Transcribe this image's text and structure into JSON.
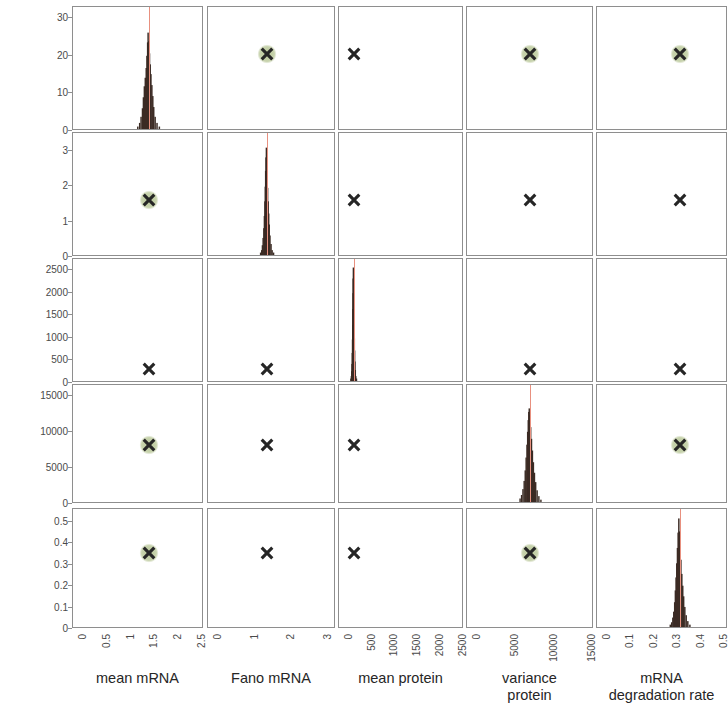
{
  "figure": {
    "title": "",
    "type": "pairs-plot",
    "n_params": 5
  },
  "row_labels": [
    {
      "lines": [
        "mean mRNA"
      ]
    },
    {
      "lines": [
        "Fano mRNA"
      ]
    },
    {
      "lines": [
        "mean protein"
      ]
    },
    {
      "lines": [
        "variance",
        "protein"
      ]
    },
    {
      "lines": [
        "mRNA",
        "degradation rate"
      ]
    }
  ],
  "col_labels": [
    {
      "lines": [
        "mean mRNA"
      ]
    },
    {
      "lines": [
        "Fano mRNA"
      ]
    },
    {
      "lines": [
        "mean protein"
      ]
    },
    {
      "lines": [
        "variance",
        "protein"
      ]
    },
    {
      "lines": [
        "mRNA",
        "degradation rate"
      ]
    }
  ],
  "y_ticks": [
    [
      "0",
      "10",
      "20",
      "30"
    ],
    [
      "0",
      "1",
      "2",
      "3"
    ],
    [
      "0",
      "500",
      "1000",
      "1500",
      "2000",
      "2500"
    ],
    [
      "0",
      "5000",
      "10000",
      "15000"
    ],
    [
      "0",
      "0.1",
      "0.2",
      "0.3",
      "0.4",
      "0.5"
    ]
  ],
  "x_ticks": [
    [
      "0",
      "0.5",
      "1",
      "1.5",
      "2",
      "2.5"
    ],
    [
      "0",
      "1",
      "2",
      "3"
    ],
    [
      "0",
      "500",
      "1000",
      "1500",
      "2000",
      "2500"
    ],
    [
      "0",
      "5000",
      "10000",
      "15000"
    ],
    [
      "0",
      "0.1",
      "0.2",
      "0.3",
      "0.4",
      "0.5"
    ]
  ],
  "colors": {
    "histogram": "#3b2b24",
    "truth_line": "#e8907f",
    "marker": "#262626",
    "halo": "#b9c79a",
    "axis": "#8e8e8e",
    "text": "#262626",
    "background": "#ffffff"
  },
  "chart_data": {
    "type": "scatter",
    "title": "",
    "xlabel": "",
    "ylabel": "",
    "parameters": [
      {
        "name": "mean mRNA",
        "axis_min": 0,
        "axis_max": 2.75,
        "tick_values": [
          0,
          0.5,
          1,
          1.5,
          2,
          2.5
        ],
        "truth": 1.6,
        "marker": 1.6
      },
      {
        "name": "Fano mRNA",
        "axis_min": 0,
        "axis_max": 3.5,
        "tick_values": [
          0,
          1,
          2,
          3
        ],
        "truth": 1.62,
        "marker": 1.62
      },
      {
        "name": "mean protein",
        "axis_min": 0,
        "axis_max": 2750,
        "tick_values": [
          0,
          500,
          1000,
          1500,
          2000,
          2500
        ],
        "truth": 320,
        "marker": 320
      },
      {
        "name": "variance protein",
        "axis_min": 0,
        "axis_max": 16500,
        "tick_values": [
          0,
          5000,
          10000,
          15000
        ],
        "truth": 8200,
        "marker": 8200
      },
      {
        "name": "mRNA degradation rate",
        "axis_min": 0,
        "axis_max": 0.56,
        "tick_values": [
          0,
          0.1,
          0.2,
          0.3,
          0.4,
          0.5
        ],
        "truth": 0.355,
        "marker": 0.355
      }
    ],
    "y_axis_ranges": [
      {
        "name": "mean mRNA",
        "min": 0,
        "max": 33,
        "tick_values": [
          0,
          10,
          20,
          30
        ]
      },
      {
        "name": "Fano mRNA",
        "min": 0,
        "max": 3.5,
        "tick_values": [
          0,
          1,
          2,
          3
        ]
      },
      {
        "name": "mean protein",
        "min": 0,
        "max": 2750,
        "tick_values": [
          0,
          500,
          1000,
          1500,
          2000,
          2500
        ]
      },
      {
        "name": "variance protein",
        "min": 0,
        "max": 16500,
        "tick_values": [
          0,
          5000,
          10000,
          15000
        ]
      },
      {
        "name": "mRNA degradation rate",
        "min": 0,
        "max": 0.56,
        "tick_values": [
          0,
          0.1,
          0.2,
          0.3,
          0.4,
          0.5
        ]
      }
    ],
    "diagonal_histograms": [
      {
        "parameter": "mean mRNA",
        "peak_x": 1.6,
        "peak_height_frac": 0.79,
        "bins_x": [
          1.38,
          1.42,
          1.45,
          1.48,
          1.5,
          1.52,
          1.54,
          1.56,
          1.575,
          1.59,
          1.6,
          1.615,
          1.63,
          1.645,
          1.66,
          1.68,
          1.7,
          1.72,
          1.75,
          1.79,
          1.84
        ],
        "bins_height": [
          0.02,
          0.05,
          0.1,
          0.17,
          0.26,
          0.35,
          0.42,
          0.5,
          0.6,
          0.71,
          0.79,
          0.72,
          0.62,
          0.53,
          0.45,
          0.36,
          0.27,
          0.18,
          0.1,
          0.05,
          0.02
        ]
      },
      {
        "parameter": "Fano mRNA",
        "peak_x": 1.62,
        "peak_height_frac": 0.88,
        "bins_x": [
          1.46,
          1.49,
          1.51,
          1.53,
          1.55,
          1.565,
          1.58,
          1.59,
          1.6,
          1.61,
          1.62,
          1.63,
          1.64,
          1.655,
          1.67,
          1.685,
          1.7,
          1.72,
          1.75,
          1.78,
          1.82
        ],
        "bins_height": [
          0.02,
          0.04,
          0.08,
          0.14,
          0.22,
          0.32,
          0.44,
          0.56,
          0.69,
          0.8,
          0.88,
          0.79,
          0.67,
          0.55,
          0.44,
          0.34,
          0.25,
          0.16,
          0.09,
          0.04,
          0.02
        ]
      },
      {
        "parameter": "mean protein",
        "peak_x": 320,
        "peak_height_frac": 0.93,
        "bins_x": [
          265,
          275,
          283,
          290,
          296,
          301,
          306,
          310,
          314,
          317,
          320,
          324,
          328,
          332,
          337,
          342,
          348,
          355,
          364,
          375,
          390
        ],
        "bins_height": [
          0.02,
          0.04,
          0.08,
          0.14,
          0.23,
          0.34,
          0.46,
          0.59,
          0.72,
          0.84,
          0.93,
          0.84,
          0.71,
          0.58,
          0.46,
          0.35,
          0.25,
          0.16,
          0.09,
          0.04,
          0.02
        ]
      },
      {
        "parameter": "variance protein",
        "peak_x": 8200,
        "peak_height_frac": 0.8,
        "bins_x": [
          7000,
          7200,
          7380,
          7540,
          7680,
          7800,
          7910,
          8000,
          8080,
          8150,
          8210,
          8300,
          8400,
          8510,
          8630,
          8760,
          8900,
          9060,
          9250,
          9480,
          9750
        ],
        "bins_height": [
          0.03,
          0.06,
          0.11,
          0.18,
          0.27,
          0.38,
          0.49,
          0.6,
          0.7,
          0.77,
          0.8,
          0.74,
          0.64,
          0.54,
          0.44,
          0.34,
          0.25,
          0.17,
          0.1,
          0.05,
          0.02
        ]
      },
      {
        "parameter": "mRNA degradation rate",
        "peak_x": 0.355,
        "peak_height_frac": 0.92,
        "bins_x": [
          0.318,
          0.324,
          0.329,
          0.333,
          0.337,
          0.34,
          0.343,
          0.346,
          0.349,
          0.352,
          0.355,
          0.358,
          0.361,
          0.364,
          0.368,
          0.372,
          0.376,
          0.381,
          0.387,
          0.394,
          0.403
        ],
        "bins_height": [
          0.02,
          0.04,
          0.08,
          0.13,
          0.21,
          0.31,
          0.42,
          0.54,
          0.67,
          0.8,
          0.92,
          0.81,
          0.69,
          0.57,
          0.45,
          0.35,
          0.26,
          0.17,
          0.1,
          0.05,
          0.02
        ]
      }
    ],
    "offdiagonal_markers": [
      {
        "row": 0,
        "col": 1,
        "x": 1.62,
        "y": 20.4,
        "halo": true
      },
      {
        "row": 0,
        "col": 2,
        "x": 320,
        "y": 20.4,
        "halo": false
      },
      {
        "row": 0,
        "col": 3,
        "x": 8200,
        "y": 20.4,
        "halo": true
      },
      {
        "row": 0,
        "col": 4,
        "x": 0.355,
        "y": 20.4,
        "halo": true
      },
      {
        "row": 1,
        "col": 0,
        "x": 1.6,
        "y": 1.62,
        "halo": true
      },
      {
        "row": 1,
        "col": 2,
        "x": 320,
        "y": 1.62,
        "halo": false
      },
      {
        "row": 1,
        "col": 3,
        "x": 8200,
        "y": 1.62,
        "halo": false
      },
      {
        "row": 1,
        "col": 4,
        "x": 0.355,
        "y": 1.62,
        "halo": false
      },
      {
        "row": 2,
        "col": 0,
        "x": 1.6,
        "y": 320,
        "halo": false
      },
      {
        "row": 2,
        "col": 1,
        "x": 1.62,
        "y": 320,
        "halo": false
      },
      {
        "row": 2,
        "col": 3,
        "x": 8200,
        "y": 320,
        "halo": false
      },
      {
        "row": 2,
        "col": 4,
        "x": 0.355,
        "y": 320,
        "halo": false
      },
      {
        "row": 3,
        "col": 0,
        "x": 1.6,
        "y": 8200,
        "halo": true
      },
      {
        "row": 3,
        "col": 1,
        "x": 1.62,
        "y": 8200,
        "halo": false
      },
      {
        "row": 3,
        "col": 2,
        "x": 320,
        "y": 8200,
        "halo": false
      },
      {
        "row": 3,
        "col": 4,
        "x": 0.355,
        "y": 8200,
        "halo": true
      },
      {
        "row": 4,
        "col": 0,
        "x": 1.6,
        "y": 0.355,
        "halo": true
      },
      {
        "row": 4,
        "col": 1,
        "x": 1.62,
        "y": 0.355,
        "halo": false
      },
      {
        "row": 4,
        "col": 2,
        "x": 320,
        "y": 0.355,
        "halo": false
      },
      {
        "row": 4,
        "col": 3,
        "x": 8200,
        "y": 0.355,
        "halo": true
      }
    ]
  }
}
